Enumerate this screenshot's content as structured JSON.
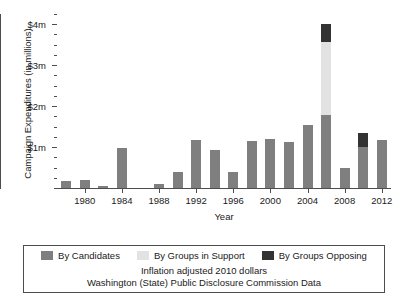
{
  "chart_data": {
    "type": "bar",
    "stacked": true,
    "title": "",
    "xlabel": "Year",
    "ylabel": "Campaign Expenditures (in millions)",
    "xlim": [
      1977,
      2013
    ],
    "ylim": [
      0,
      4.25
    ],
    "ytick_values": [
      1,
      2,
      3,
      4
    ],
    "ytick_labels": [
      "$1m",
      "$2m",
      "$3m",
      "$4m"
    ],
    "y_minor_interval": 0.25,
    "xtick_values": [
      1980,
      1984,
      1988,
      1992,
      1996,
      2000,
      2004,
      2008,
      2012
    ],
    "xtick_labels": [
      "1980",
      "1984",
      "1988",
      "1992",
      "1996",
      "2000",
      "2004",
      "2008",
      "2012"
    ],
    "grid": false,
    "legend_position": "bottom",
    "categories": [
      1978,
      1980,
      1982,
      1984,
      1986,
      1988,
      1990,
      1992,
      1994,
      1996,
      1998,
      2000,
      2002,
      2004,
      2006,
      2008,
      2010,
      2012
    ],
    "series": [
      {
        "name": "By Candidates",
        "color": "#7f7f7f",
        "values": [
          0.17,
          0.2,
          0.04,
          0.98,
          0.0,
          0.09,
          0.38,
          1.17,
          0.93,
          0.38,
          1.14,
          1.2,
          1.12,
          1.55,
          1.78,
          0.5,
          1.0,
          1.17
        ]
      },
      {
        "name": "By Groups in Support",
        "color": "#e2e2e2",
        "values": [
          0,
          0,
          0,
          0,
          0,
          0,
          0,
          0,
          0,
          0,
          0,
          0,
          0,
          0,
          1.78,
          0,
          0,
          0
        ]
      },
      {
        "name": "By Groups Opposing",
        "color": "#333333",
        "values": [
          0,
          0,
          0,
          0,
          0,
          0,
          0,
          0,
          0,
          0,
          0,
          0,
          0,
          0,
          0.45,
          0,
          0.35,
          0
        ]
      }
    ],
    "annotations": [
      "Inflation adjusted 2010 dollars",
      "Washington (State) Public Disclosure Commission Data"
    ]
  },
  "legend": {
    "items": [
      {
        "label": "By Candidates"
      },
      {
        "label": "By Groups in Support"
      },
      {
        "label": "By Groups Opposing"
      }
    ]
  },
  "caption": {
    "line1": "Inflation adjusted 2010 dollars",
    "line2": "Washington (State) Public Disclosure Commission Data"
  }
}
